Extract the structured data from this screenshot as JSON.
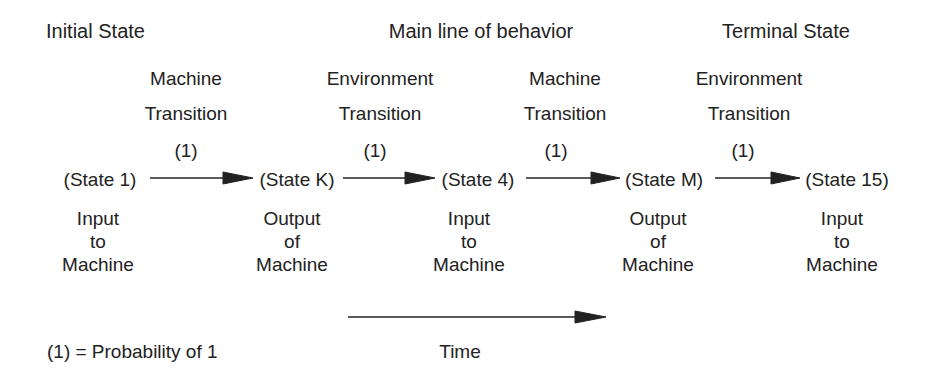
{
  "headers": {
    "initial": "Initial State",
    "main": "Main line of behavior",
    "terminal": "Terminal State"
  },
  "transitions": [
    {
      "line1": "Machine",
      "line2": "Transition",
      "prob": "(1)"
    },
    {
      "line1": "Environment",
      "line2": "Transition",
      "prob": "(1)"
    },
    {
      "line1": "Machine",
      "line2": "Transition",
      "prob": "(1)"
    },
    {
      "line1": "Environment",
      "line2": "Transition",
      "prob": "(1)"
    }
  ],
  "states": [
    {
      "label": "(State 1)",
      "desc": [
        "Input",
        "to",
        "Machine"
      ]
    },
    {
      "label": "(State K)",
      "desc": [
        "Output",
        "of",
        "Machine"
      ]
    },
    {
      "label": "(State 4)",
      "desc": [
        "Input",
        "to",
        "Machine"
      ]
    },
    {
      "label": "(State M)",
      "desc": [
        "Output",
        "of",
        "Machine"
      ]
    },
    {
      "label": "(State 15)",
      "desc": [
        "Input",
        "to",
        "Machine"
      ]
    }
  ],
  "legend": "(1) = Probability of 1",
  "time_label": "Time",
  "colors": {
    "ink": "#222222",
    "background": "#ffffff"
  }
}
